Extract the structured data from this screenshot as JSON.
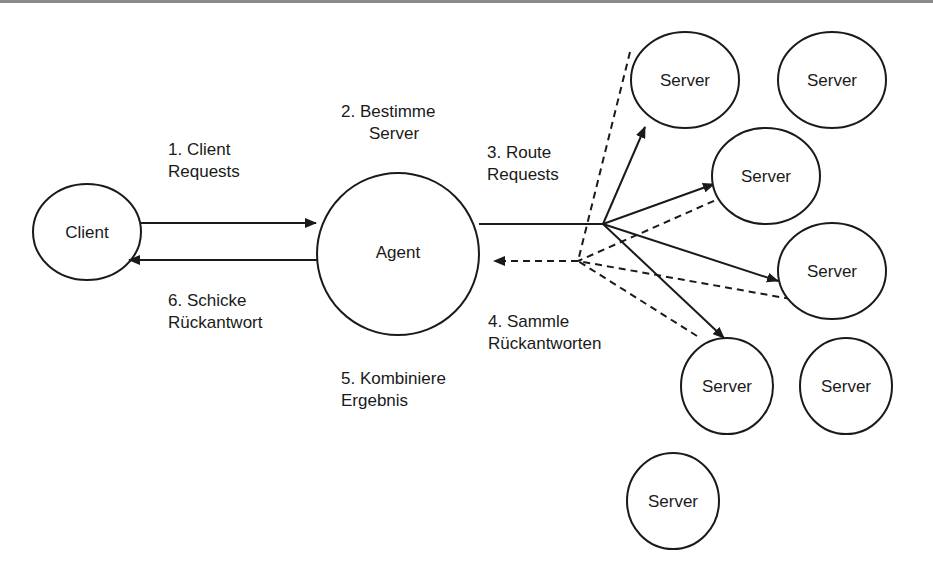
{
  "diagram": {
    "nodes": {
      "client": "Client",
      "agent": "Agent",
      "server": "Server"
    },
    "servers": [
      "Server",
      "Server",
      "Server",
      "Server",
      "Server",
      "Server",
      "Server"
    ],
    "steps": {
      "s1_line1": "1. Client",
      "s1_line2": "Requests",
      "s2_line1": "2. Bestimme",
      "s2_line2": "Server",
      "s3_line1": "3. Route",
      "s3_line2": "Requests",
      "s4_line1": "4. Sammle",
      "s4_line2": "Rückantworten",
      "s5_line1": "5. Kombiniere",
      "s5_line2": "Ergebnis",
      "s6_line1": "6. Schicke",
      "s6_line2": "Rückantwort"
    },
    "colors": {
      "stroke": "#1a1a1a",
      "background": "#ffffff"
    }
  }
}
